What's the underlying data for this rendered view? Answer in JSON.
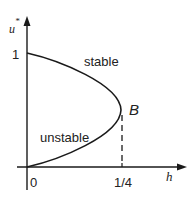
{
  "diagram": {
    "axes": {
      "y_label": "u",
      "y_label_superscript": "*",
      "x_label": "h",
      "y_tick": "1",
      "x_ticks": [
        "0",
        "1/4"
      ]
    },
    "branches": {
      "upper": "stable",
      "lower": "unstable"
    },
    "bifurcation_point": "B",
    "colors": {
      "line": "#1a1a1a",
      "background": "#ffffff"
    }
  }
}
